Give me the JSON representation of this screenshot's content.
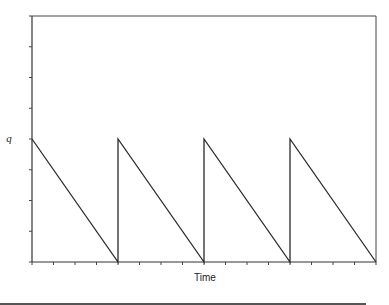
{
  "chart_data": {
    "type": "line",
    "title": "",
    "xlabel": "Time",
    "ylabel": "",
    "y_tick_labels": [
      {
        "value": 4,
        "label": "q"
      }
    ],
    "x_tick_labels": [],
    "xlim": [
      0,
      16
    ],
    "ylim": [
      0,
      8
    ],
    "x_ticks": [
      0,
      1,
      2,
      3,
      4,
      5,
      6,
      7,
      8,
      9,
      10,
      11,
      12,
      13,
      14,
      15,
      16
    ],
    "y_ticks": [
      0,
      1,
      2,
      3,
      4,
      5,
      6,
      7,
      8
    ],
    "grid": false,
    "legend": "none",
    "series": [
      {
        "name": "inventory",
        "x": [
          0,
          4,
          4,
          8,
          8,
          12,
          12,
          16
        ],
        "y": [
          4,
          0,
          4,
          0,
          4,
          0,
          4,
          0
        ]
      }
    ]
  }
}
